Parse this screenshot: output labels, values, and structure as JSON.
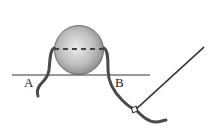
{
  "diagram": {
    "type": "physics-setup",
    "labels": {
      "point_a": "A",
      "point_b": "B"
    },
    "colors": {
      "sphere_light": "#e6e6e6",
      "sphere_dark": "#8a8a8a",
      "rope": "#4a4a4a",
      "line": "#333333",
      "dash": "#444444"
    }
  }
}
